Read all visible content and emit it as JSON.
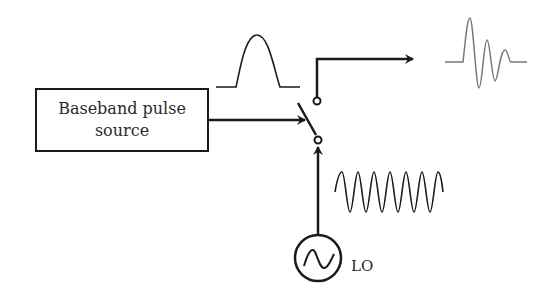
{
  "diagram": {
    "source_block": {
      "line1": "Baseband pulse",
      "line2": "source"
    },
    "oscillator": {
      "label": "LO",
      "icon": "sine-wave-icon"
    },
    "waveforms": {
      "baseband_pulse": "gaussian-pulse",
      "lo_signal": "continuous-sinusoid",
      "output": "rf-modulated-pulse"
    },
    "components": [
      "baseband-pulse-source",
      "switch",
      "local-oscillator",
      "output-arrow"
    ],
    "colors": {
      "line": "#1a1a1a",
      "output_wave": "#777777"
    }
  }
}
